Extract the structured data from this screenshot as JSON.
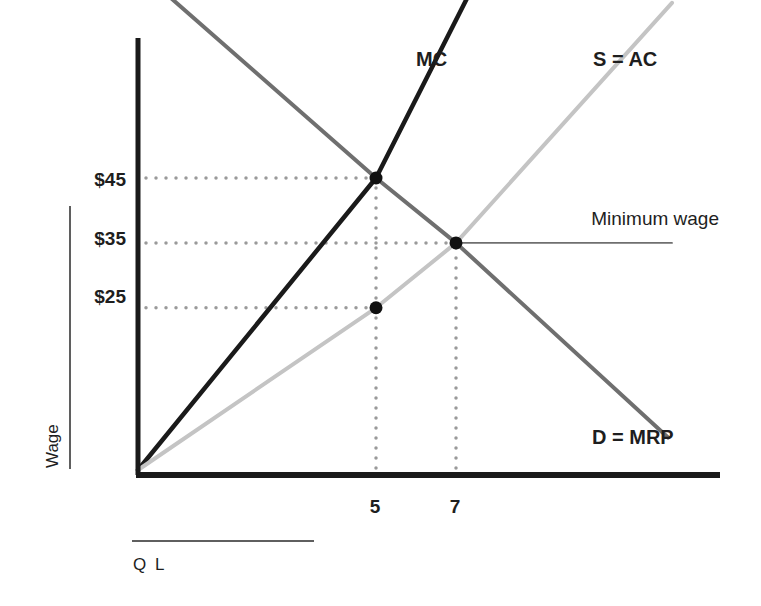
{
  "chart_data": {
    "type": "line",
    "title": "",
    "xlabel": "Q L",
    "ylabel": "Wage",
    "x_ticks": [
      5,
      7
    ],
    "x_tick_labels": [
      "5",
      "7"
    ],
    "y_ticks": [
      25,
      35,
      45
    ],
    "y_tick_labels": [
      "$25",
      "$35",
      "$45"
    ],
    "grid": false,
    "legend": "none",
    "series": [
      {
        "name": "MC",
        "label": "MC",
        "color": "#1a1a1a",
        "points": [
          [
            0,
            0
          ],
          [
            5,
            45
          ],
          [
            7.3,
            73
          ]
        ]
      },
      {
        "name": "S = AC",
        "label": "S = AC",
        "color": "#c4c4c4",
        "points": [
          [
            0,
            0
          ],
          [
            5,
            25
          ],
          [
            7,
            35
          ],
          [
            12.4,
            72
          ]
        ]
      },
      {
        "name": "D = MRP",
        "label": "D = MRP",
        "color": "#6f6f6f",
        "points": [
          [
            0.65,
            73
          ],
          [
            5,
            45
          ],
          [
            7,
            35
          ],
          [
            12.3,
            5
          ]
        ]
      },
      {
        "name": "Minimum wage",
        "label": "Minimum wage",
        "color": "#6f6f6f",
        "points": [
          [
            7,
            35
          ],
          [
            12.4,
            35
          ]
        ]
      }
    ],
    "markers": [
      {
        "name": "mc-d-intersection",
        "x": 5,
        "y": 45
      },
      {
        "name": "minimum-wage-equilibrium",
        "x": 7,
        "y": 35
      },
      {
        "name": "supply-at-q5",
        "x": 5,
        "y": 25
      }
    ],
    "guides": [
      {
        "name": "h-guide-45",
        "from": [
          0,
          45
        ],
        "to": [
          5,
          45
        ]
      },
      {
        "name": "h-guide-35",
        "from": [
          0,
          35
        ],
        "to": [
          7,
          35
        ]
      },
      {
        "name": "h-guide-25",
        "from": [
          0,
          25
        ],
        "to": [
          5,
          25
        ]
      },
      {
        "name": "v-guide-5",
        "from": [
          5,
          0
        ],
        "to": [
          5,
          45
        ]
      },
      {
        "name": "v-guide-7",
        "from": [
          7,
          0
        ],
        "to": [
          7,
          35
        ]
      }
    ],
    "colors": {
      "axis": "#1a1a1a",
      "guide": "#9a9a9a",
      "text": "#1e1e1e"
    }
  }
}
